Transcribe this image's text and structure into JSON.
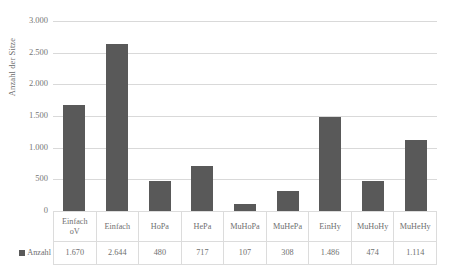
{
  "chart_data": {
    "type": "bar",
    "title": "",
    "xlabel": "",
    "ylabel": "Anzahl der Sitze",
    "ylim": [
      0,
      3000
    ],
    "ytick_step": 500,
    "grid": true,
    "legend_position": "bottom-left-table",
    "series_name": "Anzahl",
    "bar_color": "#595959",
    "categories": [
      "Einfach oV",
      "Einfach",
      "HoPa",
      "HePa",
      "MuHoPa",
      "MuHePa",
      "EinHy",
      "MuHoHy",
      "MuHeHy"
    ],
    "values": [
      1670,
      2644,
      480,
      717,
      107,
      308,
      1486,
      474,
      1114
    ],
    "value_labels": [
      "1.670",
      "2.644",
      "480",
      "717",
      "107",
      "308",
      "1.486",
      "474",
      "1.114"
    ],
    "ytick_labels": [
      "0",
      "500",
      "1.000",
      "1.500",
      "2.000",
      "2.500",
      "3.000"
    ],
    "ytick_values": [
      0,
      500,
      1000,
      1500,
      2000,
      2500,
      3000
    ]
  },
  "axis": {
    "y_title": "Anzahl der Sitze"
  },
  "table": {
    "legend_label": "Anzahl",
    "categories": [
      {
        "line1": "Einfach",
        "line2": "oV"
      },
      {
        "line1": "Einfach",
        "line2": ""
      },
      {
        "line1": "HoPa",
        "line2": ""
      },
      {
        "line1": "HePa",
        "line2": ""
      },
      {
        "line1": "MuHoPa",
        "line2": ""
      },
      {
        "line1": "MuHePa",
        "line2": ""
      },
      {
        "line1": "EinHy",
        "line2": ""
      },
      {
        "line1": "MuHoHy",
        "line2": ""
      },
      {
        "line1": "MuHeHy",
        "line2": ""
      }
    ],
    "values": [
      "1.670",
      "2.644",
      "480",
      "717",
      "107",
      "308",
      "1.486",
      "474",
      "1.114"
    ]
  },
  "icons": {
    "legend_marker": "legend-square-icon"
  }
}
